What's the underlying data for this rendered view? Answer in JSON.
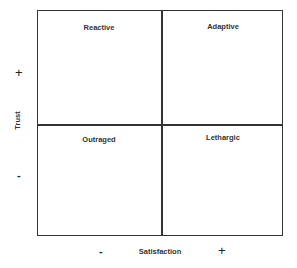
{
  "diagram": {
    "type": "2x2-matrix",
    "quadrants": {
      "top_left": "Reactive",
      "top_right": "Adaptive",
      "bottom_left": "Outraged",
      "bottom_right": "Lethargic"
    },
    "y_axis": {
      "title": "Trust",
      "high_sign": "+",
      "low_sign": "-"
    },
    "x_axis": {
      "title": "Satisfaction",
      "low_sign": "-",
      "high_sign": "+"
    },
    "colors": {
      "lines": "#333333",
      "text": "#222222",
      "background": "#ffffff"
    }
  }
}
